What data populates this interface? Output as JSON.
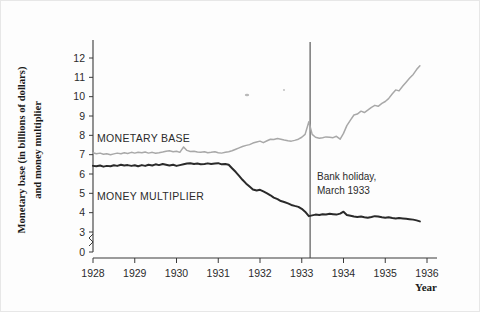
{
  "figure": {
    "background_color": "#fdfdfd",
    "y_axis_title_line1": "Monetary base (in billions of dollars)",
    "y_axis_title_line2": "and money multiplier",
    "x_axis_title": "Year"
  },
  "annotations": [
    {
      "name": "bank-holiday",
      "line1": "Bank holiday,",
      "line2": "March 1933",
      "x_value": 1933.2
    }
  ],
  "series_labels": {
    "monetary_base": "MONETARY BASE",
    "money_multiplier": "MONEY MULTIPLIER"
  },
  "colors": {
    "monetary_base": "#a8a8a8",
    "money_multiplier": "#2a2a2a",
    "axis": "#3a3a3a",
    "event_line": "#4a4a4a",
    "text": "#2b2b2b"
  },
  "chart_data": {
    "type": "line",
    "title": "",
    "xlabel": "Year",
    "ylabel": "Monetary base (in billions of dollars) and money multiplier",
    "xlim": [
      1928,
      1936
    ],
    "ylim": [
      3,
      12.5
    ],
    "y_axis_break": true,
    "y_break_between": [
      0,
      3
    ],
    "grid": false,
    "legend": "inline-labels",
    "xticks": [
      1928,
      1929,
      1930,
      1931,
      1932,
      1933,
      1934,
      1935,
      1936
    ],
    "xticklabels": [
      "1928",
      "1929",
      "1930",
      "1931",
      "1932",
      "1933",
      "1934",
      "1935",
      "1936"
    ],
    "yticks": [
      0,
      3,
      4,
      5,
      6,
      7,
      8,
      9,
      10,
      11,
      12
    ],
    "yticklabels": [
      "0",
      "3",
      "4",
      "5",
      "6",
      "7",
      "8",
      "9",
      "10",
      "11",
      "12"
    ],
    "series": [
      {
        "name": "MONETARY BASE",
        "color": "#a8a8a8",
        "x": [
          1928.0,
          1928.08,
          1928.17,
          1928.25,
          1928.33,
          1928.42,
          1928.5,
          1928.58,
          1928.67,
          1928.75,
          1928.83,
          1928.92,
          1929.0,
          1929.08,
          1929.17,
          1929.25,
          1929.33,
          1929.42,
          1929.5,
          1929.58,
          1929.67,
          1929.75,
          1929.83,
          1929.92,
          1930.0,
          1930.08,
          1930.17,
          1930.25,
          1930.33,
          1930.42,
          1930.5,
          1930.58,
          1930.67,
          1930.75,
          1930.83,
          1930.92,
          1931.0,
          1931.08,
          1931.17,
          1931.25,
          1931.33,
          1931.42,
          1931.5,
          1931.58,
          1931.67,
          1931.75,
          1931.83,
          1931.92,
          1932.0,
          1932.08,
          1932.17,
          1932.25,
          1932.33,
          1932.42,
          1932.5,
          1932.58,
          1932.67,
          1932.75,
          1932.83,
          1932.92,
          1933.0,
          1933.08,
          1933.17,
          1933.25,
          1933.33,
          1933.42,
          1933.5,
          1933.58,
          1933.67,
          1933.75,
          1933.83,
          1933.92,
          1934.0,
          1934.08,
          1934.17,
          1934.25,
          1934.33,
          1934.42,
          1934.5,
          1934.58,
          1934.67,
          1934.75,
          1934.83,
          1934.92,
          1935.0,
          1935.08,
          1935.17,
          1935.25,
          1935.33,
          1935.42,
          1935.5,
          1935.58,
          1935.67,
          1935.75,
          1935.83
        ],
        "values": [
          7.1,
          7.05,
          7.08,
          7.02,
          7.05,
          7.0,
          7.04,
          7.08,
          7.05,
          7.1,
          7.06,
          7.12,
          7.08,
          7.12,
          7.1,
          7.14,
          7.08,
          7.12,
          7.07,
          7.1,
          7.14,
          7.18,
          7.2,
          7.15,
          7.18,
          7.12,
          7.4,
          7.22,
          7.16,
          7.18,
          7.14,
          7.12,
          7.15,
          7.1,
          7.12,
          7.15,
          7.1,
          7.08,
          7.12,
          7.15,
          7.2,
          7.28,
          7.35,
          7.42,
          7.48,
          7.52,
          7.6,
          7.66,
          7.7,
          7.62,
          7.72,
          7.8,
          7.78,
          7.84,
          7.8,
          7.76,
          7.72,
          7.7,
          7.74,
          7.8,
          7.9,
          8.05,
          8.7,
          8.05,
          7.9,
          7.85,
          7.88,
          7.92,
          7.9,
          7.88,
          7.95,
          7.8,
          8.1,
          8.5,
          8.8,
          9.05,
          9.1,
          9.25,
          9.18,
          9.3,
          9.45,
          9.55,
          9.5,
          9.65,
          9.75,
          9.9,
          10.15,
          10.35,
          10.3,
          10.55,
          10.75,
          10.95,
          11.15,
          11.4,
          11.6
        ]
      },
      {
        "name": "MONEY MULTIPLIER",
        "color": "#2a2a2a",
        "x": [
          1928.0,
          1928.08,
          1928.17,
          1928.25,
          1928.33,
          1928.42,
          1928.5,
          1928.58,
          1928.67,
          1928.75,
          1928.83,
          1928.92,
          1929.0,
          1929.08,
          1929.17,
          1929.25,
          1929.33,
          1929.42,
          1929.5,
          1929.58,
          1929.67,
          1929.75,
          1929.83,
          1929.92,
          1930.0,
          1930.08,
          1930.17,
          1930.25,
          1930.33,
          1930.42,
          1930.5,
          1930.58,
          1930.67,
          1930.75,
          1930.83,
          1930.92,
          1931.0,
          1931.08,
          1931.17,
          1931.25,
          1931.33,
          1931.42,
          1931.5,
          1931.58,
          1931.67,
          1931.75,
          1931.83,
          1931.92,
          1932.0,
          1932.08,
          1932.17,
          1932.25,
          1932.33,
          1932.42,
          1932.5,
          1932.58,
          1932.67,
          1932.75,
          1932.83,
          1932.92,
          1933.0,
          1933.08,
          1933.17,
          1933.25,
          1933.33,
          1933.42,
          1933.5,
          1933.58,
          1933.67,
          1933.75,
          1933.83,
          1933.92,
          1934.0,
          1934.08,
          1934.17,
          1934.25,
          1934.33,
          1934.42,
          1934.5,
          1934.58,
          1934.67,
          1934.75,
          1934.83,
          1934.92,
          1935.0,
          1935.08,
          1935.17,
          1935.25,
          1935.33,
          1935.42,
          1935.5,
          1935.58,
          1935.67,
          1935.75,
          1935.83
        ],
        "values": [
          6.42,
          6.4,
          6.44,
          6.38,
          6.42,
          6.4,
          6.45,
          6.42,
          6.48,
          6.44,
          6.46,
          6.42,
          6.45,
          6.4,
          6.46,
          6.42,
          6.48,
          6.44,
          6.5,
          6.46,
          6.52,
          6.48,
          6.44,
          6.48,
          6.42,
          6.46,
          6.5,
          6.54,
          6.56,
          6.52,
          6.54,
          6.5,
          6.52,
          6.55,
          6.52,
          6.54,
          6.56,
          6.5,
          6.52,
          6.48,
          6.3,
          6.1,
          5.9,
          5.7,
          5.5,
          5.35,
          5.2,
          5.15,
          5.18,
          5.1,
          5.0,
          4.9,
          4.78,
          4.7,
          4.6,
          4.55,
          4.48,
          4.4,
          4.35,
          4.3,
          4.2,
          4.05,
          3.82,
          3.86,
          3.9,
          3.88,
          3.92,
          3.9,
          3.94,
          3.92,
          3.9,
          3.95,
          4.05,
          3.88,
          3.84,
          3.8,
          3.78,
          3.8,
          3.76,
          3.74,
          3.78,
          3.82,
          3.8,
          3.76,
          3.74,
          3.76,
          3.72,
          3.7,
          3.72,
          3.7,
          3.68,
          3.66,
          3.64,
          3.6,
          3.55
        ]
      }
    ]
  }
}
